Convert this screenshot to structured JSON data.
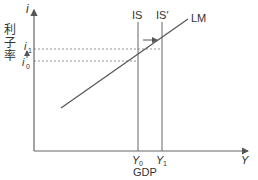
{
  "diagram": {
    "type": "IS-LM",
    "y_axis": {
      "symbol": "i",
      "label": "利子率",
      "label_chars": [
        "利",
        "子",
        "率"
      ]
    },
    "x_axis": {
      "symbol": "Y",
      "label": "GDP"
    },
    "curves": [
      {
        "name": "IS",
        "label": "IS",
        "kind": "vertical"
      },
      {
        "name": "IS-prime",
        "label": "IS′",
        "kind": "vertical"
      },
      {
        "name": "LM",
        "label": "LM",
        "kind": "upward-sloping"
      }
    ],
    "y_ticks": [
      {
        "label": "i",
        "sub": "1"
      },
      {
        "label": "i",
        "sub": "0"
      }
    ],
    "x_ticks": [
      {
        "label": "Y",
        "sub": "0"
      },
      {
        "label": "Y",
        "sub": "1"
      }
    ],
    "annotations": [
      "shift arrow IS → IS′",
      "upward arrow i0 → i1"
    ],
    "colors": {
      "line": "#555555",
      "dashed": "#777777",
      "text": "#333333"
    }
  }
}
